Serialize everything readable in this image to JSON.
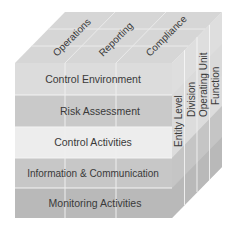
{
  "diagram": {
    "type": "coso-cube",
    "top_face": {
      "labels": [
        "Operations",
        "Reporting",
        "Compliance"
      ]
    },
    "front_face": {
      "rows": [
        {
          "label": "Control Environment",
          "color": "#dcdcdc"
        },
        {
          "label": "Risk Assessment",
          "color": "#c9c9c9"
        },
        {
          "label": "Control Activities",
          "color": "#ededed"
        },
        {
          "label": "Information & Communication",
          "color": "#c7c7c7"
        },
        {
          "label": "Monitoring Activities",
          "color": "#b9b9b9"
        }
      ]
    },
    "side_face": {
      "labels": [
        "Entity Level",
        "Division",
        "Operating Unit",
        "Function"
      ]
    },
    "colors": {
      "top_face": "#d6d6d6",
      "grid_line": "#f2f2f2",
      "text": "#3a3a3a"
    }
  }
}
